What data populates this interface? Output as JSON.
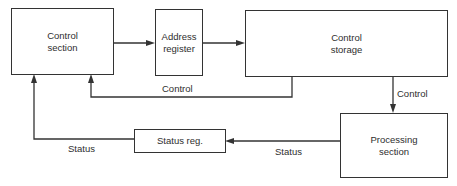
{
  "diagram": {
    "type": "block-diagram",
    "nodes": [
      {
        "id": "control-section",
        "label": "Control\nsection"
      },
      {
        "id": "address-register",
        "label": "Address\nregister"
      },
      {
        "id": "control-storage",
        "label": "Control\nstorage"
      },
      {
        "id": "processing-section",
        "label": "Processing\nsection"
      },
      {
        "id": "status-register",
        "label": "Status reg."
      }
    ],
    "edges": [
      {
        "from": "control-section",
        "to": "address-register",
        "label": ""
      },
      {
        "from": "address-register",
        "to": "control-storage",
        "label": ""
      },
      {
        "from": "control-storage",
        "to": "control-section",
        "label": "Control"
      },
      {
        "from": "control-storage",
        "to": "processing-section",
        "label": "Control"
      },
      {
        "from": "processing-section",
        "to": "status-register",
        "label": "Status"
      },
      {
        "from": "status-register",
        "to": "control-section",
        "label": "Status"
      }
    ]
  },
  "labels": {
    "control_section": "Control\nsection",
    "address_register": "Address\nregister",
    "control_storage": "Control\nstorage",
    "processing_section": "Processing\nsection",
    "status_register": "Status reg.",
    "edge_control_feedback": "Control",
    "edge_control_down": "Control",
    "edge_status_in": "Status",
    "edge_status_out": "Status"
  }
}
